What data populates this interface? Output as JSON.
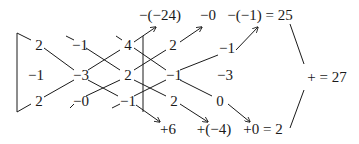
{
  "diagram": {
    "type": "sarrus-rule-determinant",
    "matrix": {
      "rows": [
        [
          "2",
          "−1",
          "4"
        ],
        [
          "−1",
          "−3",
          "2"
        ],
        [
          "2",
          "−0",
          "−1"
        ]
      ]
    },
    "extension_columns": {
      "rows": [
        [
          "2",
          "−1"
        ],
        [
          "−1",
          "−3"
        ],
        [
          "2",
          "0"
        ]
      ],
      "col1": [
        "2",
        "−1",
        "2"
      ],
      "col2": [
        "−1",
        "−3",
        "0"
      ]
    },
    "cells": [
      {
        "id": "r1c1",
        "text": "2"
      },
      {
        "id": "r1c2",
        "text": "−1"
      },
      {
        "id": "r1c3",
        "text": "4"
      },
      {
        "id": "r1c4",
        "text": "2"
      },
      {
        "id": "r1c5",
        "text": "−1"
      },
      {
        "id": "r2c1",
        "text": "−1"
      },
      {
        "id": "r2c2",
        "text": "−3"
      },
      {
        "id": "r2c3",
        "text": "2"
      },
      {
        "id": "r2c4",
        "text": "−1"
      },
      {
        "id": "r2c5",
        "text": "−3"
      },
      {
        "id": "r3c1",
        "text": "2"
      },
      {
        "id": "r3c2",
        "text": "−0"
      },
      {
        "id": "r3c3",
        "text": "−1"
      },
      {
        "id": "r3c4",
        "text": "2"
      },
      {
        "id": "r3c5",
        "text": "0"
      }
    ],
    "top_terms": [
      "−(−24)",
      "−0",
      "−(−1) = 25"
    ],
    "bottom_terms": [
      "+6",
      "+(−4)",
      "+0 = 2"
    ],
    "total": "+ = 27"
  }
}
